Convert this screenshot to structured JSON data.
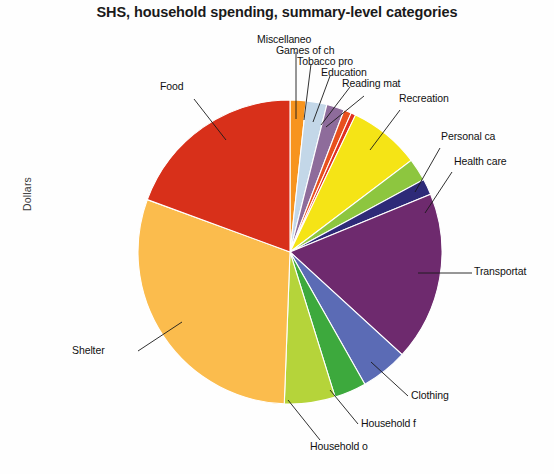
{
  "chart": {
    "title": "SHS, household spending, summary-level categories",
    "y_axis_label": "Dollars"
  },
  "chart_data": {
    "type": "pie",
    "title": "SHS, household spending, summary-level categories",
    "xlabel": "",
    "ylabel": "Dollars",
    "legend": "none",
    "grid": false,
    "start_angle_deg": 0,
    "direction": "clockwise",
    "categories": [
      "Miscellaneo",
      "Games of ch",
      "Tobacco pro",
      "Education",
      "Reading mat",
      "Recreation",
      "Personal ca",
      "Health care",
      "Transportat",
      "Clothing",
      "Household f",
      "Household o",
      "Shelter",
      "Food"
    ],
    "values": [
      1.7,
      2.2,
      1.9,
      0.8,
      0.5,
      7.6,
      2.4,
      1.7,
      18.0,
      5.0,
      3.4,
      5.4,
      30.0,
      19.4
    ],
    "colors": [
      "#F7941E",
      "#C3D7E8",
      "#8E6C9B",
      "#E8501E",
      "#E03020",
      "#F5E416",
      "#8DC63F",
      "#2E2A78",
      "#6E2A6E",
      "#5B6BB5",
      "#3DA93D",
      "#B5D43A",
      "#FBBC4D",
      "#D8301A"
    ],
    "slices": [
      {
        "label": "Miscellaneo",
        "value": 1.7,
        "color": "#F7941E"
      },
      {
        "label": "Games of ch",
        "value": 2.2,
        "color": "#C3D7E8"
      },
      {
        "label": "Tobacco pro",
        "value": 1.9,
        "color": "#8E6C9B"
      },
      {
        "label": "Education",
        "value": 0.8,
        "color": "#E8501E"
      },
      {
        "label": "Reading mat",
        "value": 0.5,
        "color": "#E03020"
      },
      {
        "label": "Recreation",
        "value": 7.6,
        "color": "#F5E416"
      },
      {
        "label": "Personal ca",
        "value": 2.4,
        "color": "#8DC63F"
      },
      {
        "label": "Health care",
        "value": 1.7,
        "color": "#2E2A78"
      },
      {
        "label": "Transportat",
        "value": 18.0,
        "color": "#6E2A6E"
      },
      {
        "label": "Clothing",
        "value": 5.0,
        "color": "#5B6BB5"
      },
      {
        "label": "Household f",
        "value": 3.4,
        "color": "#3DA93D"
      },
      {
        "label": "Household o",
        "value": 5.4,
        "color": "#B5D43A"
      },
      {
        "label": "Shelter",
        "value": 30.0,
        "color": "#FBBC4D"
      },
      {
        "label": "Food",
        "value": 19.4,
        "color": "#D8301A"
      }
    ]
  },
  "labels": {
    "miscellaneous": "Miscellaneo",
    "games_of_chance": "Games of ch",
    "tobacco_products": "Tobacco pro",
    "education": "Education",
    "reading_materials": "Reading mat",
    "recreation": "Recreation",
    "personal_care": "Personal ca",
    "health_care": "Health care",
    "transportation": "Transportat",
    "clothing": "Clothing",
    "household_furnishings": "Household f",
    "household_operations": "Household o",
    "shelter": "Shelter",
    "food": "Food"
  }
}
